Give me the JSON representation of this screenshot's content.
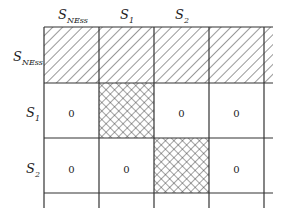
{
  "diagram": {
    "column_headers": [
      {
        "base": "S",
        "sub": "NEss"
      },
      {
        "base": "S",
        "sub": "1"
      },
      {
        "base": "S",
        "sub": "2"
      }
    ],
    "row_headers": [
      {
        "base": "S",
        "sub": "NEss"
      },
      {
        "base": "S",
        "sub": "1"
      },
      {
        "base": "S",
        "sub": "2"
      }
    ],
    "rows": [
      {
        "cells": [
          "hatched",
          "hatched",
          "hatched",
          "hatched",
          "hatched"
        ]
      },
      {
        "cells": [
          "0",
          "crosshatched",
          "0",
          "0",
          ""
        ]
      },
      {
        "cells": [
          "0",
          "0",
          "crosshatched",
          "0",
          ""
        ]
      }
    ],
    "values": {
      "r1c1": "0",
      "r1c3": "0",
      "r1c4": "0",
      "r2c1": "0",
      "r2c2": "0",
      "r2c4": "0"
    },
    "colors": {
      "line": "#333333",
      "background": "#ffffff"
    }
  }
}
